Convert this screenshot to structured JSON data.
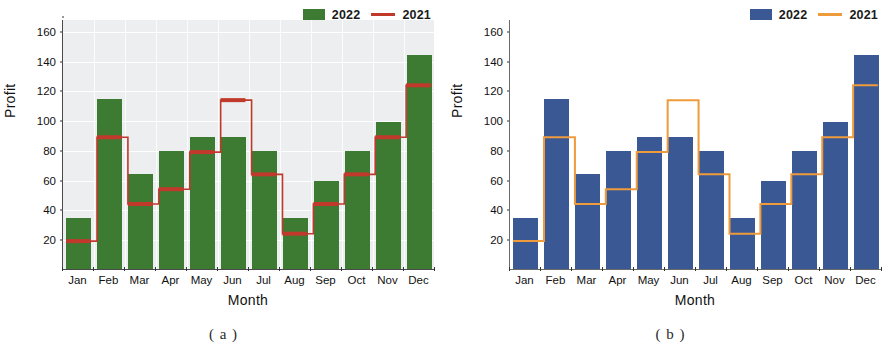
{
  "figure": {
    "panels": [
      {
        "id": "panel-a",
        "caption": "( a )",
        "legend": {
          "bar_label": "2022",
          "line_label": "2021",
          "bar_color": "#3d7b33",
          "line_color": "#c0392b"
        },
        "style": {
          "plot_background": "#eceef0",
          "gridlines": true,
          "minor_ticks": true
        },
        "chart_data": {
          "type": "bar",
          "title": "",
          "xlabel": "Month",
          "ylabel": "Profit",
          "categories": [
            "Jan",
            "Feb",
            "Mar",
            "Apr",
            "May",
            "Jun",
            "Jul",
            "Aug",
            "Sep",
            "Oct",
            "Nov",
            "Dec"
          ],
          "ylim": [
            0,
            168
          ],
          "yticks": [
            20,
            40,
            60,
            80,
            100,
            120,
            140,
            160
          ],
          "ytick_labels": [
            "20",
            "40",
            "60",
            "80",
            "100",
            "120",
            "140",
            "160"
          ],
          "grid": true,
          "legend_position": "top-right",
          "series": [
            {
              "name": "2022",
              "kind": "bar",
              "color": "#3d7b33",
              "values": [
                34,
                114,
                64,
                79,
                89,
                89,
                79,
                34,
                59,
                79,
                99,
                144
              ]
            },
            {
              "name": "2021",
              "kind": "step-line",
              "color": "#c0392b",
              "values": [
                19,
                89,
                44,
                54,
                79,
                114,
                64,
                24,
                44,
                64,
                89,
                124
              ]
            }
          ]
        }
      },
      {
        "id": "panel-b",
        "caption": "( b )",
        "legend": {
          "bar_label": "2022",
          "line_label": "2021",
          "bar_color": "#3a5894",
          "line_color": "#ef9b3c"
        },
        "style": {
          "plot_background": "#ffffff",
          "gridlines": false,
          "minor_ticks": false
        },
        "chart_data": {
          "type": "bar",
          "title": "",
          "xlabel": "Month",
          "ylabel": "Profit",
          "categories": [
            "Jan",
            "Feb",
            "Mar",
            "Apr",
            "May",
            "Jun",
            "Jul",
            "Aug",
            "Sep",
            "Oct",
            "Nov",
            "Dec"
          ],
          "ylim": [
            0,
            168
          ],
          "yticks": [
            20,
            40,
            60,
            80,
            100,
            120,
            140,
            160
          ],
          "ytick_labels": [
            "20",
            "40",
            "60",
            "80",
            "100",
            "120",
            "140",
            "160"
          ],
          "grid": false,
          "legend_position": "top-right",
          "series": [
            {
              "name": "2022",
              "kind": "bar",
              "color": "#3a5894",
              "values": [
                34,
                114,
                64,
                79,
                89,
                89,
                79,
                34,
                59,
                79,
                99,
                144
              ]
            },
            {
              "name": "2021",
              "kind": "step-line",
              "color": "#ef9b3c",
              "values": [
                19,
                89,
                44,
                54,
                79,
                114,
                64,
                24,
                44,
                64,
                89,
                124
              ]
            }
          ]
        }
      }
    ]
  }
}
